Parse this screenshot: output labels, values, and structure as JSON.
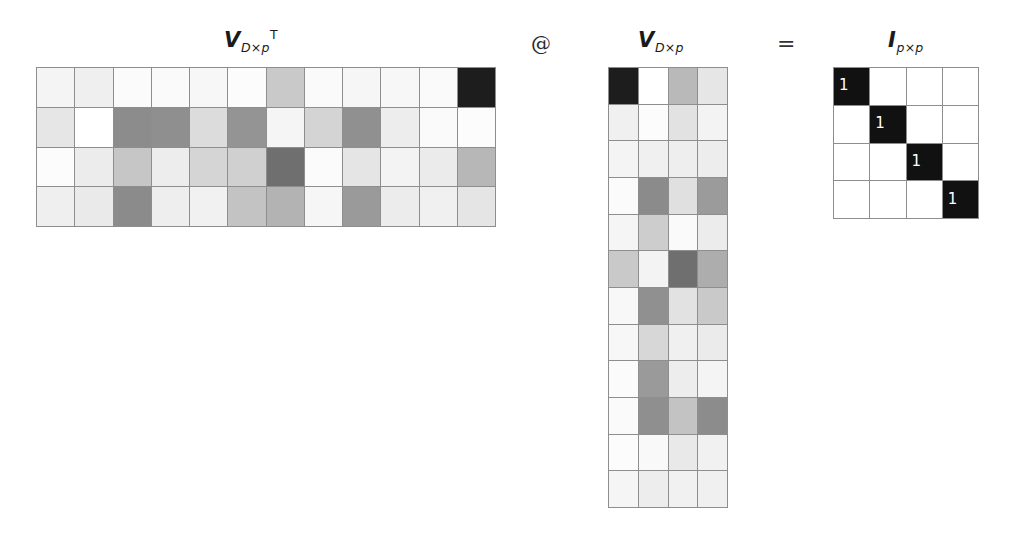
{
  "figure": {
    "background": "#ffffff",
    "grid_line_color": "#8e8e8e"
  },
  "labels": {
    "left": {
      "main": "V",
      "sub": "D×p",
      "sup": "T"
    },
    "middle": {
      "main": "V",
      "sub": "D×p",
      "sup": ""
    },
    "right": {
      "main": "I",
      "sub": "p×p",
      "sup": ""
    }
  },
  "operators": {
    "matmul": "@",
    "equals": "="
  },
  "matrices": {
    "left": {
      "name": "V-transpose",
      "rows": 4,
      "cols": 12,
      "values": [
        [
          "#f4f4f4",
          "#efefef",
          "#fbfbfb",
          "#fafafa",
          "#f7f7f7",
          "#fcfcfc",
          "#c9c9c9",
          "#fafafa",
          "#f6f6f6",
          "#f7f7f7",
          "#fafafa",
          "#1d1d1d"
        ],
        [
          "#e6e6e6",
          "#ffffff",
          "#8c8c8c",
          "#8f8f8f",
          "#dcdcdc",
          "#949494",
          "#f5f5f5",
          "#d4d4d4",
          "#909090",
          "#ededed",
          "#fafafa",
          "#fcfcfc"
        ],
        [
          "#fcfcfc",
          "#ececec",
          "#c6c6c6",
          "#ededed",
          "#d5d5d5",
          "#d0d0d0",
          "#6f6f6f",
          "#fbfbfb",
          "#e5e5e5",
          "#f3f3f3",
          "#ebebeb",
          "#b7b7b7"
        ],
        [
          "#efefef",
          "#eaeaea",
          "#8b8b8b",
          "#eeeeee",
          "#f1f1f1",
          "#c3c3c3",
          "#b3b3b3",
          "#f6f6f6",
          "#9a9a9a",
          "#ececec",
          "#f0f0f0",
          "#e5e5e5"
        ]
      ]
    },
    "middle": {
      "name": "V",
      "rows": 12,
      "cols": 4,
      "values": [
        [
          "#1d1d1d",
          "#ffffff",
          "#b9b9b9",
          "#e6e6e6"
        ],
        [
          "#f0f0f0",
          "#fcfcfc",
          "#e2e2e2",
          "#f3f3f3"
        ],
        [
          "#f4f4f4",
          "#f0f0f0",
          "#eeeeee",
          "#ededed"
        ],
        [
          "#fbfbfb",
          "#8b8b8b",
          "#e0e0e0",
          "#9b9b9b"
        ],
        [
          "#f5f5f5",
          "#cdcdcd",
          "#fafafa",
          "#ececec"
        ],
        [
          "#c9c9c9",
          "#f3f3f3",
          "#6f6f6f",
          "#adadad"
        ],
        [
          "#f8f8f8",
          "#909090",
          "#e2e2e2",
          "#c9c9c9"
        ],
        [
          "#f7f7f7",
          "#d7d7d7",
          "#f0f0f0",
          "#ebebeb"
        ],
        [
          "#fbfbfb",
          "#9a9a9a",
          "#ededed",
          "#f4f4f4"
        ],
        [
          "#fafafa",
          "#8f8f8f",
          "#c3c3c3",
          "#8c8c8c"
        ],
        [
          "#fcfcfc",
          "#f9f9f9",
          "#e9e9e9",
          "#f1f1f1"
        ],
        [
          "#f5f5f5",
          "#ededed",
          "#f1f1f1",
          "#f0f0f0"
        ]
      ]
    },
    "right": {
      "name": "identity",
      "rows": 4,
      "cols": 4,
      "diagonal_label": "1",
      "on_color": "#111111",
      "off_color": "#ffffff",
      "values": [
        [
          1,
          0,
          0,
          0
        ],
        [
          0,
          1,
          0,
          0
        ],
        [
          0,
          0,
          1,
          0
        ],
        [
          0,
          0,
          0,
          1
        ]
      ]
    }
  }
}
